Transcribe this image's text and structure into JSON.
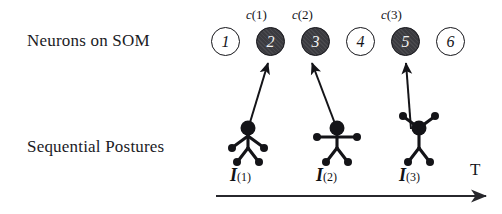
{
  "figure": {
    "rows": {
      "neurons_label": "Neurons on SOM",
      "postures_label": "Sequential Postures"
    },
    "time_axis": {
      "label": "T",
      "direction": "left-to-right"
    }
  },
  "som_neurons": [
    {
      "id": "neuron-1",
      "number": "1",
      "active": false,
      "c_label_var": "",
      "c_label_index": ""
    },
    {
      "id": "neuron-2",
      "number": "2",
      "active": true,
      "c_label_var": "c",
      "c_label_index": "(1)"
    },
    {
      "id": "neuron-3",
      "number": "3",
      "active": true,
      "c_label_var": "c",
      "c_label_index": "(2)"
    },
    {
      "id": "neuron-4",
      "number": "4",
      "active": false,
      "c_label_var": "",
      "c_label_index": ""
    },
    {
      "id": "neuron-5",
      "number": "5",
      "active": true,
      "c_label_var": "c",
      "c_label_index": "(3)"
    },
    {
      "id": "neuron-6",
      "number": "6",
      "active": false,
      "c_label_var": "",
      "c_label_index": ""
    }
  ],
  "postures": [
    {
      "id": "posture-1",
      "var": "I",
      "index": "(1)",
      "pose": "arms-down-outward",
      "maps_to": "neuron-2"
    },
    {
      "id": "posture-2",
      "var": "I",
      "index": "(2)",
      "pose": "arms-horizontal-t-pose",
      "maps_to": "neuron-3"
    },
    {
      "id": "posture-3",
      "var": "I",
      "index": "(3)",
      "pose": "arms-raised-v",
      "maps_to": "neuron-5"
    }
  ],
  "colors": {
    "ink": "#141418",
    "active_neuron_fill": "#3b3b40",
    "active_neuron_text": "#f2f2f2",
    "inactive_neuron_fill": "#ffffff",
    "background": "#ffffff"
  }
}
